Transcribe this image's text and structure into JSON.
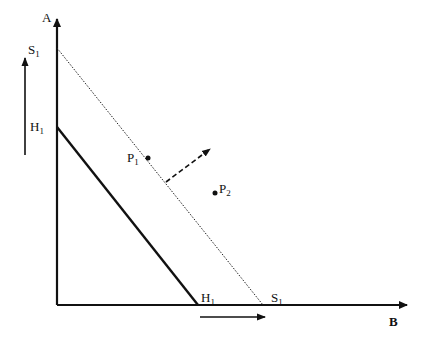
{
  "diagram": {
    "axes": {
      "vertical_label": "A",
      "horizontal_label": "B"
    },
    "lines": [
      {
        "id": "H",
        "label_main": "H",
        "label_sub": "1",
        "style": "solid-thick"
      },
      {
        "id": "S",
        "label_main": "S",
        "label_sub": "1",
        "style": "dotted"
      }
    ],
    "points": [
      {
        "id": "P1",
        "label_main": "P",
        "label_sub": "1"
      },
      {
        "id": "P2",
        "label_main": "P",
        "label_sub": "2"
      }
    ],
    "arrows": {
      "vertical_shift": "up",
      "horizontal_shift": "right",
      "direction_vector": "dashed outward (north-east)"
    }
  }
}
